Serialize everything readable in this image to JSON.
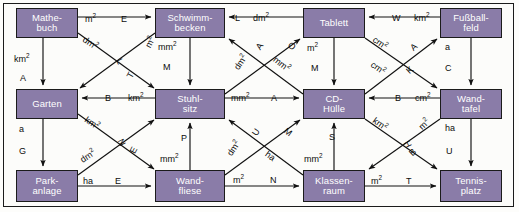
{
  "diagram": {
    "node_fill": "#8a7ca8",
    "node_text_color": "#ffffff",
    "line_color": "#111111",
    "border_color": "#1b1b1b",
    "background": "#fcfcfa",
    "nodes": [
      {
        "id": "mathebuch",
        "label": "Mathe-\nbuch",
        "x": 16,
        "y": 8,
        "w": 62,
        "h": 30
      },
      {
        "id": "schwimmbecken",
        "label": "Schwimm-\nbecken",
        "x": 155,
        "y": 8,
        "w": 70,
        "h": 30
      },
      {
        "id": "tablett",
        "label": "Tablett",
        "x": 303,
        "y": 8,
        "w": 62,
        "h": 30
      },
      {
        "id": "fussballfeld",
        "label": "Fußball-\nfeld",
        "x": 440,
        "y": 8,
        "w": 62,
        "h": 30
      },
      {
        "id": "garten",
        "label": "Garten",
        "x": 16,
        "y": 89,
        "w": 62,
        "h": 30
      },
      {
        "id": "stuhlsitz",
        "label": "Stuhl-\nsitz",
        "x": 155,
        "y": 89,
        "w": 70,
        "h": 30
      },
      {
        "id": "cdhuelle",
        "label": "CD-\nHülle",
        "x": 303,
        "y": 89,
        "w": 62,
        "h": 30
      },
      {
        "id": "wandtafel",
        "label": "Wand-\ntafel",
        "x": 440,
        "y": 89,
        "w": 62,
        "h": 30
      },
      {
        "id": "parkanlage",
        "label": "Park-\nanlage",
        "x": 16,
        "y": 170,
        "w": 62,
        "h": 32
      },
      {
        "id": "wandfliese",
        "label": "Wand-\nfliese",
        "x": 155,
        "y": 170,
        "w": 70,
        "h": 32
      },
      {
        "id": "klassenraum",
        "label": "Klassen-\nraum",
        "x": 303,
        "y": 170,
        "w": 62,
        "h": 32
      },
      {
        "id": "tennisplatz",
        "label": "Tennis-\nplatz",
        "x": 440,
        "y": 170,
        "w": 62,
        "h": 32
      }
    ],
    "edges": [
      {
        "id": "e01",
        "from": "mathebuch",
        "to": "schwimmbecken",
        "unit": "m²",
        "letter": "E"
      },
      {
        "id": "e02",
        "from": "mathebuch",
        "to": "garten",
        "unit": "km²",
        "letter": "A"
      },
      {
        "id": "e03",
        "from": "mathebuch",
        "to": "stuhlsitz",
        "unit": "dm²",
        "letter": "L"
      },
      {
        "id": "e04",
        "from": "schwimmbecken",
        "to": "garten",
        "unit": "m²",
        "letter": "T"
      },
      {
        "id": "e05",
        "from": "schwimmbecken",
        "to": "stuhlsitz",
        "unit": "mm²",
        "letter": "M"
      },
      {
        "id": "e06",
        "from": "tablett",
        "to": "schwimmbecken",
        "unit": "dm²",
        "letter": "L"
      },
      {
        "id": "e07",
        "from": "fussballfeld",
        "to": "tablett",
        "unit": "km²",
        "letter": "W"
      },
      {
        "id": "e08",
        "from": "fussballfeld",
        "to": "wandtafel",
        "unit": "a",
        "letter": "C"
      },
      {
        "id": "e09",
        "from": "cdhuelle",
        "to": "schwimmbecken",
        "unit": "dm²",
        "letter": "A"
      },
      {
        "id": "e10",
        "from": "stuhlsitz",
        "to": "tablett",
        "unit": "mm²",
        "letter": "O"
      },
      {
        "id": "e11",
        "from": "tablett",
        "to": "cdhuelle",
        "unit": "m²",
        "letter": "M"
      },
      {
        "id": "e12",
        "from": "cdhuelle",
        "to": "fussballfeld",
        "unit": "cm²",
        "letter": "A"
      },
      {
        "id": "e13",
        "from": "tablett",
        "to": "wandtafel",
        "unit": "cm²",
        "letter": "K"
      },
      {
        "id": "e14",
        "from": "stuhlsitz",
        "to": "garten",
        "unit": "km²",
        "letter": "B"
      },
      {
        "id": "e15",
        "from": "stuhlsitz",
        "to": "cdhuelle",
        "unit": "mm²",
        "letter": "A"
      },
      {
        "id": "e16",
        "from": "wandtafel",
        "to": "cdhuelle",
        "unit": "cm²",
        "letter": "B"
      },
      {
        "id": "e17",
        "from": "garten",
        "to": "parkanlage",
        "unit": "a",
        "letter": "G"
      },
      {
        "id": "e18",
        "from": "garten",
        "to": "wandfliese",
        "unit": "km²",
        "letter": "N"
      },
      {
        "id": "e19",
        "from": "parkanlage",
        "to": "stuhlsitz",
        "unit": "dm²",
        "letter": "E"
      },
      {
        "id": "e20",
        "from": "parkanlage",
        "to": "wandfliese",
        "unit": "ha",
        "letter": "E"
      },
      {
        "id": "e21",
        "from": "wandfliese",
        "to": "stuhlsitz",
        "unit": "mm²",
        "letter": "P"
      },
      {
        "id": "e22",
        "from": "klassenraum",
        "to": "stuhlsitz",
        "unit": "dm²",
        "letter": "U"
      },
      {
        "id": "e23",
        "from": "wandfliese",
        "to": "cdhuelle",
        "unit": "ha",
        "letter": "M"
      },
      {
        "id": "e24",
        "from": "klassenraum",
        "to": "cdhuelle",
        "unit": "mm²",
        "letter": "S"
      },
      {
        "id": "e25",
        "from": "wandfliese",
        "to": "klassenraum",
        "unit": "m²",
        "letter": "N"
      },
      {
        "id": "e26",
        "from": "cdhuelle",
        "to": "tennisplatz",
        "unit": "km²",
        "letter": "H"
      },
      {
        "id": "e27",
        "from": "wandtafel",
        "to": "klassenraum",
        "unit": "m²",
        "letter": "B"
      },
      {
        "id": "e28",
        "from": "wandtafel",
        "to": "tennisplatz",
        "unit": "ha",
        "letter": "U"
      },
      {
        "id": "e29",
        "from": "klassenraum",
        "to": "tennisplatz",
        "unit": "m²",
        "letter": "T"
      }
    ],
    "labels": [
      {
        "id": "l01",
        "text": "m",
        "sup": "2",
        "x": 85,
        "y": 15,
        "rot": 0,
        "edge": "e01"
      },
      {
        "id": "l02",
        "text": "E",
        "sup": "",
        "x": 121,
        "y": 15,
        "rot": 0,
        "edge": "e01"
      },
      {
        "id": "l03",
        "text": "km",
        "sup": "2",
        "x": 14,
        "y": 55,
        "rot": 0,
        "edge": "e02"
      },
      {
        "id": "l04",
        "text": "A",
        "sup": "",
        "x": 20,
        "y": 74,
        "rot": 0,
        "edge": "e02"
      },
      {
        "id": "l05",
        "text": "dm",
        "sup": "2",
        "x": 82,
        "y": 39,
        "rot": 34,
        "edge": "e03"
      },
      {
        "id": "l06",
        "text": "L",
        "sup": "",
        "x": 117,
        "y": 57,
        "rot": 62,
        "edge": "e03"
      },
      {
        "id": "l07",
        "text": "m",
        "sup": "2",
        "x": 145,
        "y": 38,
        "rot": -62,
        "edge": "e04"
      },
      {
        "id": "l08",
        "text": "T",
        "sup": "",
        "x": 128,
        "y": 71,
        "rot": -62,
        "edge": "e04"
      },
      {
        "id": "l09",
        "text": "mm",
        "sup": "2",
        "x": 158,
        "y": 43,
        "rot": 0,
        "edge": "e05"
      },
      {
        "id": "l10",
        "text": "M",
        "sup": "",
        "x": 163,
        "y": 63,
        "rot": 0,
        "edge": "e05"
      },
      {
        "id": "l11",
        "text": "L",
        "sup": "",
        "x": 235,
        "y": 14,
        "rot": 0,
        "edge": "e06"
      },
      {
        "id": "l12",
        "text": "dm",
        "sup": "2",
        "x": 253,
        "y": 14,
        "rot": 0,
        "edge": "e06"
      },
      {
        "id": "l13",
        "text": "W",
        "sup": "",
        "x": 392,
        "y": 14,
        "rot": 0,
        "edge": "e07"
      },
      {
        "id": "l14",
        "text": "km",
        "sup": "2",
        "x": 414,
        "y": 14,
        "rot": 0,
        "edge": "e07"
      },
      {
        "id": "l15",
        "text": "a",
        "sup": "",
        "x": 445,
        "y": 43,
        "rot": 0,
        "edge": "e08"
      },
      {
        "id": "l16",
        "text": "C",
        "sup": "",
        "x": 445,
        "y": 64,
        "rot": 0,
        "edge": "e08"
      },
      {
        "id": "l17",
        "text": "dm",
        "sup": "2",
        "x": 233,
        "y": 58,
        "rot": -55,
        "edge": "e09"
      },
      {
        "id": "l18",
        "text": "A",
        "sup": "",
        "x": 257,
        "y": 42,
        "rot": -55,
        "edge": "e09"
      },
      {
        "id": "l19",
        "text": "mm",
        "sup": "2",
        "x": 272,
        "y": 60,
        "rot": 38,
        "edge": "e10"
      },
      {
        "id": "l20",
        "text": "O",
        "sup": "",
        "x": 288,
        "y": 42,
        "rot": 38,
        "edge": "e10"
      },
      {
        "id": "l21",
        "text": "m",
        "sup": "2",
        "x": 307,
        "y": 44,
        "rot": 0,
        "edge": "e11"
      },
      {
        "id": "l22",
        "text": "M",
        "sup": "",
        "x": 311,
        "y": 64,
        "rot": 0,
        "edge": "e11"
      },
      {
        "id": "l23",
        "text": "cm",
        "sup": "2",
        "x": 372,
        "y": 39,
        "rot": 36,
        "edge": "e13"
      },
      {
        "id": "l24",
        "text": "cm",
        "sup": "2",
        "x": 370,
        "y": 64,
        "rot": 36,
        "edge": "e13"
      },
      {
        "id": "l25",
        "text": "A",
        "sup": "",
        "x": 411,
        "y": 43,
        "rot": -42,
        "edge": "e12"
      },
      {
        "id": "l26",
        "text": "K",
        "sup": "",
        "x": 407,
        "y": 66,
        "rot": -42,
        "edge": "e12"
      },
      {
        "id": "l27",
        "text": "B",
        "sup": "",
        "x": 105,
        "y": 94,
        "rot": 0,
        "edge": "e14"
      },
      {
        "id": "l28",
        "text": "km",
        "sup": "2",
        "x": 128,
        "y": 94,
        "rot": 0,
        "edge": "e14"
      },
      {
        "id": "l29",
        "text": "mm",
        "sup": "2",
        "x": 231,
        "y": 94,
        "rot": 0,
        "edge": "e15"
      },
      {
        "id": "l30",
        "text": "A",
        "sup": "",
        "x": 271,
        "y": 94,
        "rot": 0,
        "edge": "e15"
      },
      {
        "id": "l31",
        "text": "B",
        "sup": "",
        "x": 395,
        "y": 94,
        "rot": 0,
        "edge": "e16"
      },
      {
        "id": "l32",
        "text": "cm",
        "sup": "2",
        "x": 415,
        "y": 94,
        "rot": 0,
        "edge": "e16"
      },
      {
        "id": "l33",
        "text": "a",
        "sup": "",
        "x": 19,
        "y": 125,
        "rot": 0,
        "edge": "e17"
      },
      {
        "id": "l34",
        "text": "G",
        "sup": "",
        "x": 19,
        "y": 147,
        "rot": 0,
        "edge": "e17"
      },
      {
        "id": "l35",
        "text": "km",
        "sup": "2",
        "x": 84,
        "y": 119,
        "rot": 34,
        "edge": "e18"
      },
      {
        "id": "l36",
        "text": "N",
        "sup": "",
        "x": 118,
        "y": 138,
        "rot": 64,
        "edge": "e18"
      },
      {
        "id": "l37",
        "text": "dm",
        "sup": "2",
        "x": 80,
        "y": 152,
        "rot": -34,
        "edge": "e19"
      },
      {
        "id": "l38",
        "text": "E",
        "sup": "",
        "x": 131,
        "y": 146,
        "rot": -62,
        "edge": "e19"
      },
      {
        "id": "l39",
        "text": "ha",
        "sup": "",
        "x": 83,
        "y": 177,
        "rot": 0,
        "edge": "e20"
      },
      {
        "id": "l40",
        "text": "E",
        "sup": "",
        "x": 115,
        "y": 177,
        "rot": 0,
        "edge": "e20"
      },
      {
        "id": "l41",
        "text": "P",
        "sup": "",
        "x": 181,
        "y": 134,
        "rot": 0,
        "edge": "e21"
      },
      {
        "id": "l42",
        "text": "mm",
        "sup": "2",
        "x": 160,
        "y": 155,
        "rot": 0,
        "edge": "e21"
      },
      {
        "id": "l43",
        "text": "dm",
        "sup": "2",
        "x": 226,
        "y": 144,
        "rot": -55,
        "edge": "e22"
      },
      {
        "id": "l44",
        "text": "U",
        "sup": "",
        "x": 253,
        "y": 128,
        "rot": -55,
        "edge": "e22"
      },
      {
        "id": "l45",
        "text": "ha",
        "sup": "",
        "x": 265,
        "y": 152,
        "rot": 36,
        "edge": "e23"
      },
      {
        "id": "l46",
        "text": "M",
        "sup": "",
        "x": 284,
        "y": 128,
        "rot": 36,
        "edge": "e23"
      },
      {
        "id": "l47",
        "text": "S",
        "sup": "",
        "x": 329,
        "y": 133,
        "rot": 0,
        "edge": "e24"
      },
      {
        "id": "l48",
        "text": "mm",
        "sup": "2",
        "x": 304,
        "y": 155,
        "rot": 0,
        "edge": "e24"
      },
      {
        "id": "l49",
        "text": "m",
        "sup": "2",
        "x": 233,
        "y": 176,
        "rot": 0,
        "edge": "e25"
      },
      {
        "id": "l50",
        "text": "N",
        "sup": "",
        "x": 270,
        "y": 176,
        "rot": 0,
        "edge": "e25"
      },
      {
        "id": "l51",
        "text": "km",
        "sup": "2",
        "x": 372,
        "y": 120,
        "rot": 36,
        "edge": "e26"
      },
      {
        "id": "l52",
        "text": "H",
        "sup": "",
        "x": 404,
        "y": 140,
        "rot": 62,
        "edge": "e26"
      },
      {
        "id": "l53",
        "text": "m",
        "sup": "2",
        "x": 419,
        "y": 120,
        "rot": -44,
        "edge": "e27"
      },
      {
        "id": "l54",
        "text": "B",
        "sup": "",
        "x": 410,
        "y": 148,
        "rot": -44,
        "edge": "e27"
      },
      {
        "id": "l55",
        "text": "ha",
        "sup": "",
        "x": 445,
        "y": 124,
        "rot": 0,
        "edge": "e28"
      },
      {
        "id": "l56",
        "text": "U",
        "sup": "",
        "x": 446,
        "y": 147,
        "rot": 0,
        "edge": "e28"
      },
      {
        "id": "l57",
        "text": "m",
        "sup": "2",
        "x": 371,
        "y": 177,
        "rot": 0,
        "edge": "e29"
      },
      {
        "id": "l58",
        "text": "T",
        "sup": "",
        "x": 406,
        "y": 177,
        "rot": 0,
        "edge": "e29"
      }
    ],
    "paths": [
      {
        "id": "p01",
        "edge": "e01",
        "d": "M78,17 L151,17"
      },
      {
        "id": "p02",
        "edge": "e02",
        "d": "M43,38 L43,85"
      },
      {
        "id": "p03",
        "edge": "e03",
        "d": "M78,33 L154,88"
      },
      {
        "id": "p04",
        "edge": "e04",
        "d": "M155,33 L80,88"
      },
      {
        "id": "p05",
        "edge": "e05",
        "d": "M190,38 L190,85"
      },
      {
        "id": "p06",
        "edge": "e06",
        "d": "M303,17 L229,17"
      },
      {
        "id": "p07",
        "edge": "e07",
        "d": "M440,17 L369,17"
      },
      {
        "id": "p08",
        "edge": "e08",
        "d": "M471,38 L471,85"
      },
      {
        "id": "p09",
        "edge": "e09",
        "d": "M303,94 L229,39"
      },
      {
        "id": "p10",
        "edge": "e10",
        "d": "M225,94 L300,39"
      },
      {
        "id": "p11",
        "edge": "e11",
        "d": "M334,38 L334,85"
      },
      {
        "id": "p12",
        "edge": "e12",
        "d": "M365,94 L437,39"
      },
      {
        "id": "p13",
        "edge": "e13",
        "d": "M365,38 L437,88"
      },
      {
        "id": "p14",
        "edge": "e14",
        "d": "M155,98 L82,98"
      },
      {
        "id": "p15",
        "edge": "e15",
        "d": "M225,98 L299,98"
      },
      {
        "id": "p16",
        "edge": "e16",
        "d": "M440,98 L369,98"
      },
      {
        "id": "p17",
        "edge": "e17",
        "d": "M43,119 L43,166"
      },
      {
        "id": "p18",
        "edge": "e18",
        "d": "M78,114 L154,169"
      },
      {
        "id": "p19",
        "edge": "e19",
        "d": "M78,175 L154,120"
      },
      {
        "id": "p20",
        "edge": "e20",
        "d": "M78,186 L151,186"
      },
      {
        "id": "p21",
        "edge": "e21",
        "d": "M190,170 L190,123"
      },
      {
        "id": "p22",
        "edge": "e22",
        "d": "M303,175 L229,120"
      },
      {
        "id": "p23",
        "edge": "e23",
        "d": "M225,175 L300,120"
      },
      {
        "id": "p24",
        "edge": "e24",
        "d": "M334,170 L334,123"
      },
      {
        "id": "p25",
        "edge": "e25",
        "d": "M225,186 L299,186"
      },
      {
        "id": "p26",
        "edge": "e26",
        "d": "M365,119 L437,169"
      },
      {
        "id": "p27",
        "edge": "e27",
        "d": "M440,119 L369,169"
      },
      {
        "id": "p28",
        "edge": "e28",
        "d": "M471,119 L471,166"
      },
      {
        "id": "p29",
        "edge": "e29",
        "d": "M365,186 L436,186"
      }
    ]
  }
}
